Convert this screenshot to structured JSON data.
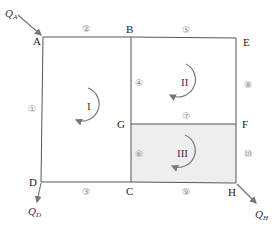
{
  "diagram": {
    "nodes": [
      {
        "id": "A",
        "label": "A"
      },
      {
        "id": "B",
        "label": "B"
      },
      {
        "id": "C",
        "label": "C"
      },
      {
        "id": "D",
        "label": "D"
      },
      {
        "id": "E",
        "label": "E"
      },
      {
        "id": "F",
        "label": "F"
      },
      {
        "id": "G",
        "label": "G"
      },
      {
        "id": "H",
        "label": "H"
      }
    ],
    "pipes": [
      {
        "id": 1,
        "label": "①",
        "from": "A",
        "to": "D"
      },
      {
        "id": 2,
        "label": "②",
        "from": "A",
        "to": "B"
      },
      {
        "id": 3,
        "label": "③",
        "from": "D",
        "to": "C"
      },
      {
        "id": 4,
        "label": "④",
        "from": "B",
        "to": "G"
      },
      {
        "id": 5,
        "label": "⑤",
        "from": "B",
        "to": "E"
      },
      {
        "id": 6,
        "label": "⑥",
        "from": "G",
        "to": "C"
      },
      {
        "id": 7,
        "label": "⑦",
        "from": "G",
        "to": "F"
      },
      {
        "id": 8,
        "label": "⑧",
        "from": "E",
        "to": "F"
      },
      {
        "id": 9,
        "label": "⑨",
        "from": "C",
        "to": "H"
      },
      {
        "id": 10,
        "label": "⑩",
        "from": "F",
        "to": "H"
      }
    ],
    "loops": [
      {
        "id": "I",
        "label": "I",
        "direction": "clockwise"
      },
      {
        "id": "II",
        "label": "II",
        "direction": "clockwise"
      },
      {
        "id": "III",
        "label": "III",
        "direction": "clockwise",
        "shaded": true
      }
    ],
    "flows": [
      {
        "id": "QA",
        "symbol": "Q",
        "sub": "A",
        "node": "A",
        "direction": "in"
      },
      {
        "id": "QD",
        "symbol": "Q",
        "sub": "D",
        "node": "D",
        "direction": "out"
      },
      {
        "id": "QH",
        "symbol": "Q",
        "sub": "H",
        "node": "H",
        "direction": "out"
      }
    ],
    "colors": {
      "line": "#555555",
      "shade": "#eeeeee",
      "arrow": "#777777"
    }
  }
}
